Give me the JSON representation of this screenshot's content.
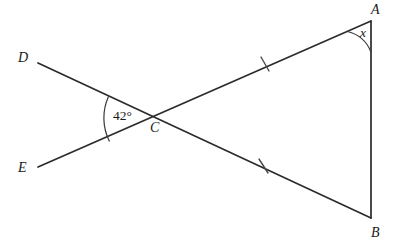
{
  "figure": {
    "type": "geometry-diagram",
    "background_color": "#ffffff",
    "line_color": "#2b2b2b"
  },
  "points": [
    {
      "id": "A",
      "label": "A",
      "x": 371,
      "y": 21
    },
    {
      "id": "B",
      "label": "B",
      "x": 371,
      "y": 218
    },
    {
      "id": "C",
      "label": "C",
      "x": 158,
      "y": 119
    },
    {
      "id": "D",
      "label": "D",
      "x": 38,
      "y": 63
    },
    {
      "id": "E",
      "label": "E",
      "x": 38,
      "y": 167
    }
  ],
  "segments": [
    {
      "id": "DB",
      "from": "D",
      "through": "C",
      "to": "B",
      "style": "solid"
    },
    {
      "id": "EA",
      "from": "E",
      "through": "C",
      "to": "A",
      "style": "solid"
    },
    {
      "id": "AB",
      "from": "A",
      "to": "B",
      "style": "solid"
    }
  ],
  "tick_marks": [
    {
      "id": "tick-CA",
      "on_segment": "CA",
      "x": 265,
      "y": 64,
      "count": 1
    },
    {
      "id": "tick-CB",
      "on_segment": "CB",
      "x": 264,
      "y": 166,
      "count": 1
    }
  ],
  "angles": [
    {
      "id": "angle-DCE",
      "vertex": "C",
      "label": "42°",
      "value": 42,
      "unit": "degrees",
      "opens": "left",
      "label_x": 113,
      "label_y": 109
    },
    {
      "id": "angle-CAB",
      "vertex": "A",
      "label": "x",
      "value": null,
      "unit": "unknown",
      "opens": "down-left",
      "label_x": 360,
      "label_y": 26
    }
  ]
}
